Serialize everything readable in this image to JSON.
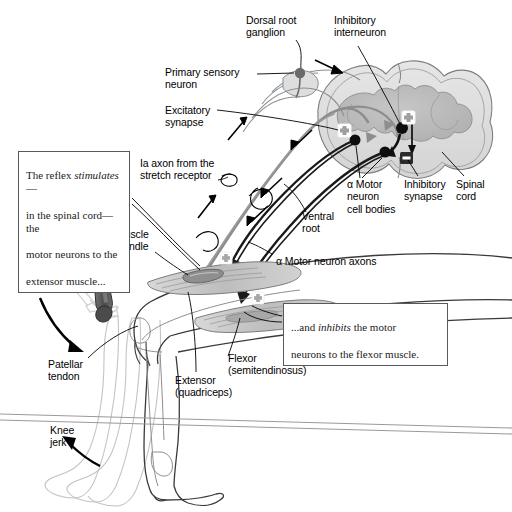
{
  "figure": {
    "background_color": "#ffffff",
    "ink_color": "#000000",
    "gray_matter_color": "#b9b9b9",
    "white_matter_color": "#dcdcdc",
    "muscle_fill_color": "#c9c9c9",
    "outline_color": "#6f7478"
  },
  "labels": {
    "dorsal_root_ganglion": "Dorsal root\nganglion",
    "inhibitory_interneuron": "Inhibitory\ninterneuron",
    "primary_sensory_neuron": "Primary sensory\nneuron",
    "excitatory_synapse": "Excitatory\nsynapse",
    "ia_axon": "Ia axon from the\nstretch receptor",
    "alpha_motor_cell_bodies": "α Motor\nneuron\ncell bodies",
    "inhibitory_synapse": "Inhibitory\nsynapse",
    "spinal_cord": "Spinal\ncord",
    "ventral_root": "Ventral\nroot",
    "muscle_spindle": "Muscle\nspindle",
    "alpha_motor_axons": "α Motor neuron axons",
    "patellar_tendon": "Patellar\ntendon",
    "extensor": "Extensor\n(quadriceps)",
    "flexor": "Flexor\n(semitendinosus)",
    "knee_jerk": "Knee\njerk"
  },
  "callouts": {
    "stimulates": {
      "line1_a": "The reflex ",
      "line1_italic": "stimulates",
      "line1_b": "—",
      "line2": "in the spinal cord—the",
      "line3": "motor neurons to the",
      "line4": "extensor muscle..."
    },
    "inhibits": {
      "line1_a": "...and ",
      "line1_italic": "inhibits",
      "line1_b": " the motor",
      "line2": "neurons to the flexor muscle."
    }
  },
  "synapse_symbols": {
    "excitatory_extensor": "+",
    "excitatory_interneuron": "+",
    "inhibitory": "–",
    "spindle_plus": "+",
    "flexor_plus": "+"
  }
}
